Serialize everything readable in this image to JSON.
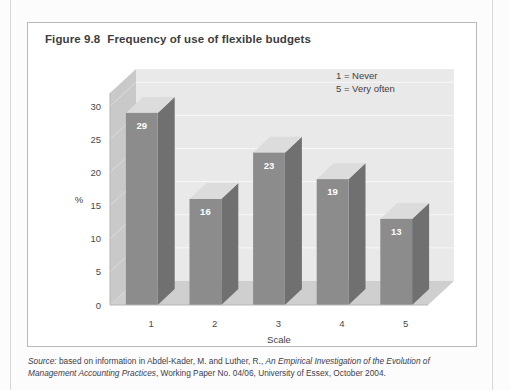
{
  "figure": {
    "number": "Figure 9.8",
    "title": "Frequency of use of flexible budgets"
  },
  "legend": {
    "line1": "1 = Never",
    "line2": "5 = Very often"
  },
  "source": {
    "label": "Source:",
    "text_part1": " based on information in Abdel-Kader, M. and Luther, R., ",
    "italic_title": "An Empirical Investigation of the Evolution of Management Accounting Practices",
    "text_part2": ", Working Paper No. 04/06, University of Essex, October 2004."
  },
  "colors": {
    "bar_front": "#8c8c8c",
    "bar_side": "#707070",
    "bar_top": "#dcdcdc",
    "back_wall": "#e9e9e9",
    "side_wall": "#c9c9c9",
    "floor": "#cfcfcf",
    "gridline": "#f7f7f7",
    "frame": "#b9b9b9",
    "title": "#3d3d3d"
  },
  "chart_data": {
    "type": "bar",
    "title": "Frequency of use of flexible budgets",
    "categories": [
      "1",
      "2",
      "3",
      "4",
      "5"
    ],
    "values": [
      29,
      16,
      23,
      19,
      13
    ],
    "xlabel": "Scale",
    "ylabel": "%",
    "ylim": [
      0,
      32
    ],
    "yticks": [
      0,
      5,
      10,
      15,
      20,
      25,
      30
    ],
    "ytick_labels": [
      "0",
      "5",
      "10",
      "15",
      "20",
      "25",
      "30"
    ],
    "grid": true,
    "legend_position": "top-right",
    "annotations": [
      "1 = Never",
      "5 = Very often"
    ],
    "style": "3d-column"
  }
}
